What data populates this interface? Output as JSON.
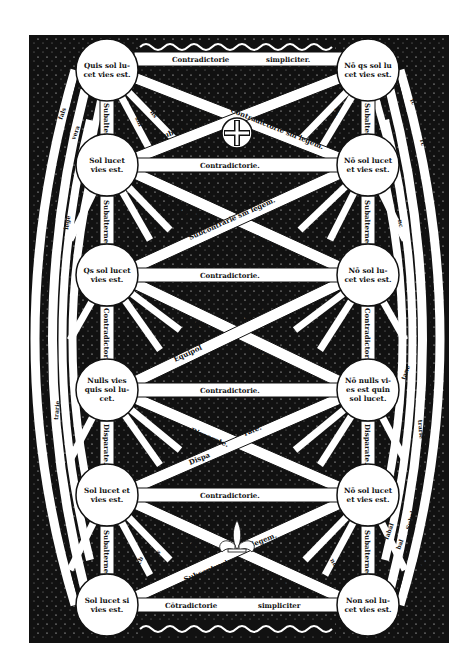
{
  "diagram": {
    "type": "woodcut-square-of-opposition",
    "colors": {
      "ink": "#111111",
      "paper": "#ffffff"
    },
    "nodes": [
      {
        "id": "n1",
        "lines": [
          "Quis sol lu-",
          "cet vies est."
        ]
      },
      {
        "id": "n2",
        "lines": [
          "Nō qs sol lu",
          "cet vies est."
        ]
      },
      {
        "id": "n3",
        "lines": [
          "Sol lucet ",
          "vies est."
        ]
      },
      {
        "id": "n4",
        "lines": [
          "Nō sol lucet",
          "et vies est."
        ]
      },
      {
        "id": "n5",
        "lines": [
          "Qs sol lucet",
          "vies est."
        ]
      },
      {
        "id": "n6",
        "lines": [
          "Nō sol lu-",
          "cet vies est."
        ]
      },
      {
        "id": "n7",
        "lines": [
          "Nulls vies ",
          "quis sol lu-",
          "cet."
        ]
      },
      {
        "id": "n8",
        "lines": [
          "Nō nulls vi-",
          "es est quin",
          "sol lucet."
        ]
      },
      {
        "id": "n9",
        "lines": [
          "Sol lucet et",
          "vies est."
        ]
      },
      {
        "id": "n10",
        "lines": [
          "Nō sol lucet",
          "et vies est."
        ]
      },
      {
        "id": "n11",
        "lines": [
          "Sol lucet si",
          "vies est."
        ]
      },
      {
        "id": "n12",
        "lines": [
          "Non sol lu-",
          "cet vies est."
        ]
      }
    ],
    "horizontal_bands": [
      {
        "row": 1,
        "left": "Contradictorie",
        "right": "simpliciter."
      },
      {
        "row": 2,
        "text": "Contradictorie."
      },
      {
        "row": 3,
        "text": "Contradictorie."
      },
      {
        "row": 4,
        "text": "Contradictorie."
      },
      {
        "row": 5,
        "text": "Contradictorie."
      },
      {
        "row": 6,
        "left": "Cōtradictorie",
        "right": "simpliciter"
      }
    ],
    "vertical_bands": [
      {
        "side": "left",
        "pair": "1-2",
        "text": "Subalterne."
      },
      {
        "side": "right",
        "pair": "1-2",
        "text": "Subalterne."
      },
      {
        "side": "left",
        "pair": "2-3",
        "text": "Subalterne."
      },
      {
        "side": "right",
        "pair": "2-3",
        "text": "Subalterne."
      },
      {
        "side": "left",
        "pair": "3-4",
        "text": "Contradictorie."
      },
      {
        "side": "right",
        "pair": "3-4",
        "text": "Contradictorie."
      },
      {
        "side": "left",
        "pair": "4-5",
        "text": "Disparate."
      },
      {
        "side": "right",
        "pair": "4-5",
        "text": "Disparate."
      },
      {
        "side": "left",
        "pair": "5-6",
        "text": "Subalterne."
      },
      {
        "side": "right",
        "pair": "5-6",
        "text": "Subalterne."
      }
    ],
    "diagonal_bands": [
      {
        "text": "Contradictorie sm legem."
      },
      {
        "text": "Subcōtrarie"
      },
      {
        "text": "Contrarie sm"
      },
      {
        "text": "Subcontrarie sm legem."
      },
      {
        "text": "legem."
      },
      {
        "text": "Equipol"
      },
      {
        "text": "lentes."
      },
      {
        "text": "Equipol"
      },
      {
        "text": "lentes."
      },
      {
        "text": "Disparate."
      },
      {
        "text": "rate."
      },
      {
        "text": "Dispa"
      },
      {
        "text": "Contradictorie"
      },
      {
        "text": "sm legem."
      },
      {
        "text": "Subcontrarie"
      },
      {
        "text": "sm legem."
      }
    ],
    "ray_labels": [
      "fals",
      "vera",
      "lege",
      "sm",
      "ns",
      "fc",
      "rc",
      "nc",
      "Ad",
      "ad",
      "cb",
      "dis",
      "nd",
      "Dis",
      "trarie",
      "trarie",
      "bal",
      "fabal",
      "Subal",
      "tane"
    ],
    "ornaments": [
      "cross-medallion",
      "fleur-de-lis",
      "rope-border-top",
      "rope-border-bottom",
      "foliage-corners"
    ]
  }
}
